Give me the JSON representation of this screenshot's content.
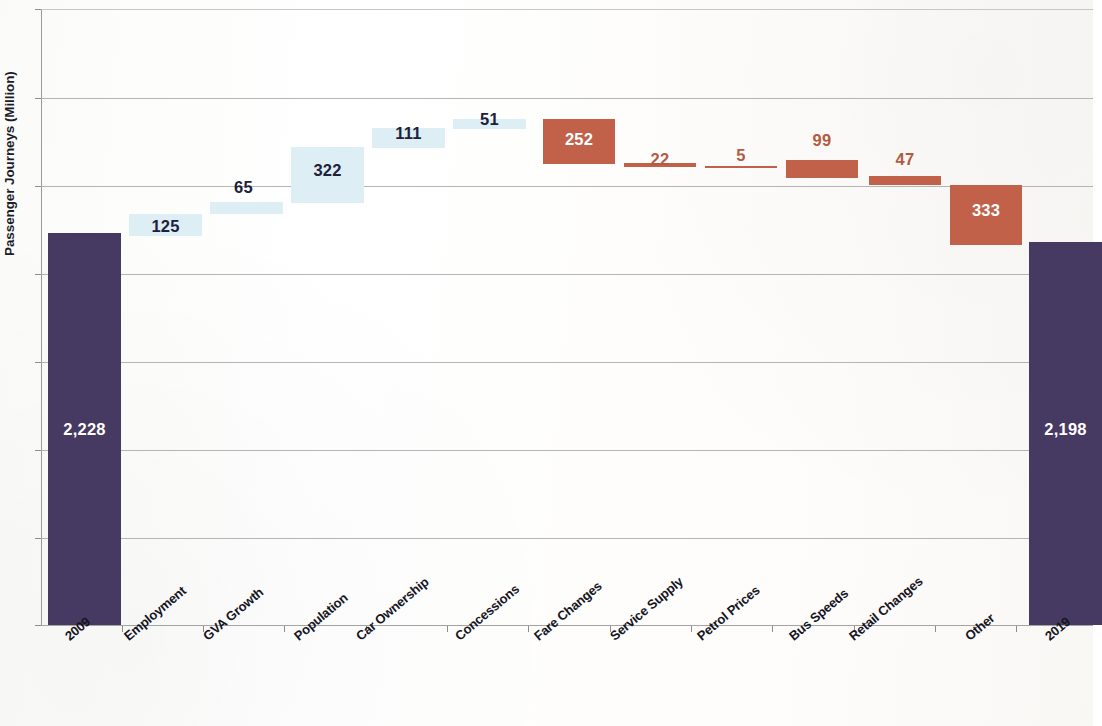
{
  "chart_data": {
    "type": "bar",
    "subtype": "waterfall",
    "title": "",
    "xlabel": "",
    "ylabel": "Passenger Journeys (Million)",
    "ylim": [
      0,
      2800
    ],
    "grid": true,
    "legend": false,
    "categories": [
      "2009",
      "Employment",
      "GVA Growth",
      "Population",
      "Car Ownership",
      "Concessions",
      "Fare Changes",
      "Service Supply",
      "Petrol Prices",
      "Bus Speeds",
      "Retail Changes",
      "Other",
      "2019"
    ],
    "values": [
      2228,
      125,
      65,
      322,
      111,
      51,
      -252,
      -22,
      -5,
      -99,
      -47,
      -333,
      2198
    ],
    "value_labels": [
      "2,228",
      "125",
      "65",
      "322",
      "111",
      "51",
      "252",
      "22",
      "5",
      "99",
      "47",
      "333",
      "2,198"
    ],
    "kinds": [
      "total",
      "up",
      "up",
      "up",
      "up",
      "up",
      "down",
      "down",
      "down",
      "down",
      "down",
      "down",
      "total"
    ],
    "cumulative_start": [
      0,
      2228,
      2353,
      2418,
      2740,
      2851,
      2902,
      2650,
      2628,
      2623,
      2524,
      2477,
      0
    ],
    "cumulative_end": [
      2228,
      2353,
      2418,
      2740,
      2851,
      2902,
      2650,
      2628,
      2623,
      2524,
      2477,
      2144,
      2198
    ],
    "colors": {
      "total": "#473a62",
      "increase": "#ddeef5",
      "decrease": "#c1614a",
      "gridline": "#a8a8a8",
      "axis": "#8d8d8d",
      "text": "#15151f",
      "decrease_label": "#b35a42"
    }
  },
  "axis": {
    "y_title": "Passenger Journeys (Million)"
  },
  "bars": [
    {
      "label": "2,228",
      "category": "2009",
      "kind": "total",
      "x": 48,
      "y": 233,
      "w": 73,
      "h": 392,
      "label_x": 48,
      "label_y": 420,
      "label_w": 73,
      "label_place": "inside"
    },
    {
      "label": "125",
      "category": "Employment",
      "kind": "up",
      "x": 129,
      "y": 214,
      "w": 73,
      "h": 22,
      "label_x": 129,
      "label_y": 217,
      "label_w": 73,
      "label_place": "inside-out"
    },
    {
      "label": "65",
      "category": "GVA Growth",
      "kind": "up",
      "x": 210,
      "y": 202,
      "w": 73,
      "h": 12,
      "label_x": 207,
      "label_y": 178,
      "label_w": 73,
      "label_place": "above"
    },
    {
      "label": "322",
      "category": "Population",
      "kind": "up",
      "x": 291,
      "y": 147,
      "w": 73,
      "h": 56,
      "label_x": 291,
      "label_y": 161,
      "label_w": 73,
      "label_place": "inside-out"
    },
    {
      "label": "111",
      "category": "Car Ownership",
      "kind": "up",
      "x": 372,
      "y": 128,
      "w": 73,
      "h": 20,
      "label_x": 372,
      "label_y": 124,
      "label_w": 73,
      "label_place": "inside-out"
    },
    {
      "label": "51",
      "category": "Concessions",
      "kind": "up",
      "x": 453,
      "y": 119,
      "w": 73,
      "h": 10,
      "label_x": 453,
      "label_y": 110,
      "label_w": 73,
      "label_place": "above"
    },
    {
      "label": "252",
      "category": "Fare Changes",
      "kind": "down",
      "x": 543,
      "y": 119,
      "w": 72,
      "h": 45,
      "label_x": 543,
      "label_y": 130,
      "label_w": 72,
      "label_place": "inside"
    },
    {
      "label": "22",
      "category": "Service Supply",
      "kind": "down",
      "x": 624,
      "y": 163,
      "w": 72,
      "h": 4,
      "label_x": 624,
      "label_y": 150,
      "label_w": 72,
      "label_place": "above"
    },
    {
      "label": "5",
      "category": "Petrol Prices",
      "kind": "down",
      "x": 705,
      "y": 166,
      "w": 72,
      "h": 2,
      "label_x": 705,
      "label_y": 146,
      "label_w": 72,
      "label_place": "above"
    },
    {
      "label": "99",
      "category": "Bus Speeds",
      "kind": "down",
      "x": 786,
      "y": 160,
      "w": 72,
      "h": 18,
      "label_x": 786,
      "label_y": 131,
      "label_w": 72,
      "label_place": "above"
    },
    {
      "label": "47",
      "category": "Retail Changes",
      "kind": "down",
      "x": 869,
      "y": 176,
      "w": 72,
      "h": 9,
      "label_x": 869,
      "label_y": 150,
      "label_w": 72,
      "label_place": "above"
    },
    {
      "label": "333",
      "category": "Other",
      "kind": "down",
      "x": 950,
      "y": 185,
      "w": 72,
      "h": 60,
      "label_x": 950,
      "label_y": 201,
      "label_w": 72,
      "label_place": "inside"
    },
    {
      "label": "2,198",
      "category": "2019",
      "kind": "total",
      "x": 1029,
      "y": 242,
      "w": 73,
      "h": 383,
      "label_x": 1029,
      "label_y": 420,
      "label_w": 73,
      "label_place": "inside"
    }
  ],
  "gridlines_y": [
    9,
    98,
    186,
    274,
    362,
    450,
    538,
    625
  ],
  "x_labels": [
    {
      "text": "2009",
      "x": 62
    },
    {
      "text": "Employment",
      "x": 121
    },
    {
      "text": "GVA Growth",
      "x": 200
    },
    {
      "text": "Population",
      "x": 291
    },
    {
      "text": "Car Ownership",
      "x": 353
    },
    {
      "text": "Concessions",
      "x": 452
    },
    {
      "text": "Fare Changes",
      "x": 531
    },
    {
      "text": "Service Supply",
      "x": 607
    },
    {
      "text": "Petrol Prices",
      "x": 694
    },
    {
      "text": "Bus Speeds",
      "x": 786
    },
    {
      "text": "Retail Changes",
      "x": 846
    },
    {
      "text": "Other",
      "x": 962
    },
    {
      "text": "2019",
      "x": 1042
    }
  ],
  "x_ticks": [
    122,
    203,
    284,
    366,
    447,
    528,
    610,
    691,
    772,
    854,
    935,
    1016
  ]
}
